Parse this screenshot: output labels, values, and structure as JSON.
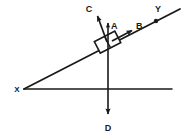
{
  "diagram": {
    "type": "physics-free-body-diagram",
    "background_color": "#ffffff",
    "stroke_color": "#1a1a1a",
    "labels": {
      "incline_left_vertex": "X",
      "incline_right_end": "Y",
      "vector_up": "A",
      "vector_along_incline": "B",
      "vector_up_left": "C",
      "vector_down": "D"
    },
    "elements": {
      "incline_line_name": "inclined-plane-line",
      "ground_line_name": "horizontal-ground-line",
      "block_name": "block-on-incline",
      "vertex_marker_name": "incline-point-marker"
    },
    "geometry": {
      "incline_start_x": 24,
      "incline_start_y": 89,
      "incline_end_x": 180,
      "incline_end_y": 9,
      "ground_start_x": 24,
      "ground_start_y": 89,
      "ground_end_x": 172,
      "ground_end_y": 89,
      "block_center_x": 108,
      "block_center_y": 43,
      "vector_a_tip_x": 108,
      "vector_a_tip_y": 20,
      "vector_b_tip_x": 134,
      "vector_b_tip_y": 29,
      "vector_c_tip_x": 96,
      "vector_c_tip_y": 13,
      "vector_d_tip_x": 108,
      "vector_d_tip_y": 116
    }
  }
}
